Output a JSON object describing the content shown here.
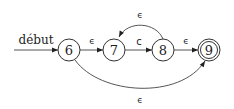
{
  "diagram": {
    "type": "nfa",
    "start_label": "début",
    "states": [
      {
        "id": "6",
        "label": "6",
        "accepting": false
      },
      {
        "id": "7",
        "label": "7",
        "accepting": false
      },
      {
        "id": "8",
        "label": "8",
        "accepting": false
      },
      {
        "id": "9",
        "label": "9",
        "accepting": true
      }
    ],
    "transitions": [
      {
        "from": "6",
        "to": "7",
        "label": "ϵ"
      },
      {
        "from": "7",
        "to": "8",
        "label": "c"
      },
      {
        "from": "8",
        "to": "7",
        "label": "ϵ"
      },
      {
        "from": "8",
        "to": "9",
        "label": "ϵ"
      },
      {
        "from": "6",
        "to": "9",
        "label": "ϵ"
      }
    ]
  }
}
